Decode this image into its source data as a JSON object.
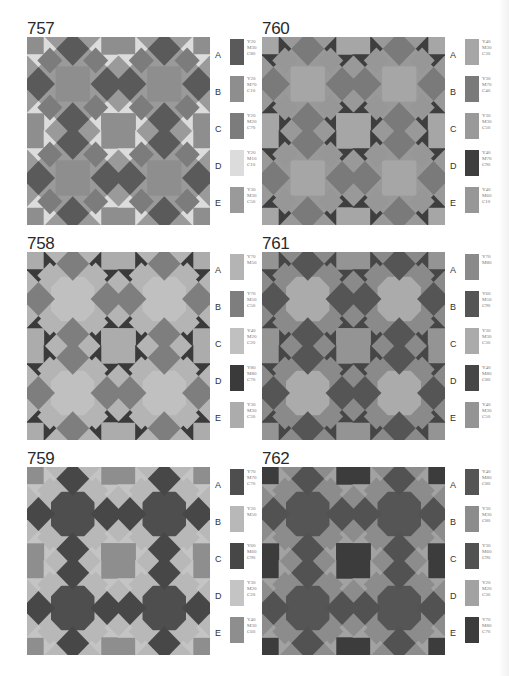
{
  "panels": [
    {
      "id": "757",
      "title": "757",
      "x": 27,
      "y": 20,
      "style": "star",
      "legend": [
        {
          "letter": "A",
          "code": "Y20\nM30\nC80",
          "color": "#5a5a5a"
        },
        {
          "letter": "B",
          "code": "Y20\nM70\nC10",
          "color": "#8e8e8e"
        },
        {
          "letter": "C",
          "code": "Y20\nM20\nC70",
          "color": "#7c7c7c"
        },
        {
          "letter": "D",
          "code": "Y20\nM10\nC10",
          "color": "#dcdcdc"
        },
        {
          "letter": "E",
          "code": "Y30\nM30\nC50",
          "color": "#9a9a9a"
        }
      ],
      "roles": {
        "bg": "#9a9a9a",
        "diamond": "#5a5a5a",
        "square": "#8e8e8e",
        "tri": "#dcdcdc",
        "alt": "#7c7c7c"
      }
    },
    {
      "id": "760",
      "title": "760",
      "x": 262,
      "y": 20,
      "style": "star",
      "legend": [
        {
          "letter": "A",
          "code": "Y40\nM30\nC30",
          "color": "#a6a6a6"
        },
        {
          "letter": "B",
          "code": "Y30\nM70\nC40",
          "color": "#7a7a7a"
        },
        {
          "letter": "C",
          "code": "Y30\nM30\nC50",
          "color": "#999999"
        },
        {
          "letter": "D",
          "code": "Y40\nM70\nC90",
          "color": "#3e3e3e"
        },
        {
          "letter": "E",
          "code": "Y40\nM60\nC10",
          "color": "#979797"
        }
      ],
      "roles": {
        "bg": "#999999",
        "diamond": "#7a7a7a",
        "square": "#a6a6a6",
        "tri": "#3e3e3e",
        "alt": "#979797"
      }
    },
    {
      "id": "758",
      "title": "758",
      "x": 27,
      "y": 235,
      "style": "octagon",
      "legend": [
        {
          "letter": "A",
          "code": "Y70\nM50",
          "color": "#b4b4b4"
        },
        {
          "letter": "B",
          "code": "Y70\nM50\nC50",
          "color": "#7e7e7e"
        },
        {
          "letter": "C",
          "code": "Y40\nM20\nC20",
          "color": "#c0c0c0"
        },
        {
          "letter": "D",
          "code": "Y80\nM80\nC70",
          "color": "#3a3a3a"
        },
        {
          "letter": "E",
          "code": "Y30\nM30\nC30",
          "color": "#acacac"
        }
      ],
      "roles": {
        "bg": "#b4b4b4",
        "diamond": "#7e7e7e",
        "square": "#acacac",
        "tri": "#3a3a3a",
        "alt": "#c0c0c0"
      }
    },
    {
      "id": "761",
      "title": "761",
      "x": 262,
      "y": 235,
      "style": "octagon",
      "legend": [
        {
          "letter": "A",
          "code": "Y70\nM80",
          "color": "#8a8a8a"
        },
        {
          "letter": "B",
          "code": "Y60\nM50\nC90",
          "color": "#555555"
        },
        {
          "letter": "C",
          "code": "Y30\nM30\nC30",
          "color": "#ababab"
        },
        {
          "letter": "D",
          "code": "Y40\nM80\nC80",
          "color": "#464646"
        },
        {
          "letter": "E",
          "code": "Y40\nM30\nC50",
          "color": "#949494"
        }
      ],
      "roles": {
        "bg": "#8a8a8a",
        "diamond": "#555555",
        "square": "#949494",
        "tri": "#464646",
        "alt": "#ababab"
      }
    },
    {
      "id": "759",
      "title": "759",
      "x": 27,
      "y": 450,
      "style": "octagon",
      "legend": [
        {
          "letter": "A",
          "code": "Y70\nM70\nC70",
          "color": "#4e4e4e"
        },
        {
          "letter": "B",
          "code": "Y20\nM50",
          "color": "#b8b8b8"
        },
        {
          "letter": "C",
          "code": "Y60\nM60\nC90",
          "color": "#474747"
        },
        {
          "letter": "D",
          "code": "Y30\nM20\nC20",
          "color": "#c4c4c4"
        },
        {
          "letter": "E",
          "code": "Y40\nM30\nC60",
          "color": "#8e8e8e"
        }
      ],
      "roles": {
        "bg": "#b8b8b8",
        "diamond": "#474747",
        "square": "#8e8e8e",
        "tri": "#c4c4c4",
        "alt": "#4e4e4e"
      }
    },
    {
      "id": "762",
      "title": "762",
      "x": 262,
      "y": 450,
      "style": "octagon",
      "legend": [
        {
          "letter": "A",
          "code": "Y40\nM80\nC80",
          "color": "#555555"
        },
        {
          "letter": "B",
          "code": "Y30\nM30\nC80",
          "color": "#8c8c8c"
        },
        {
          "letter": "C",
          "code": "Y30\nM60\nC90",
          "color": "#525252"
        },
        {
          "letter": "D",
          "code": "Y20\nM20\nC30",
          "color": "#a2a2a2"
        },
        {
          "letter": "E",
          "code": "Y70\nM80\nC70",
          "color": "#3c3c3c"
        }
      ],
      "roles": {
        "bg": "#8c8c8c",
        "diamond": "#525252",
        "square": "#3c3c3c",
        "tri": "#a2a2a2",
        "alt": "#555555"
      }
    }
  ]
}
